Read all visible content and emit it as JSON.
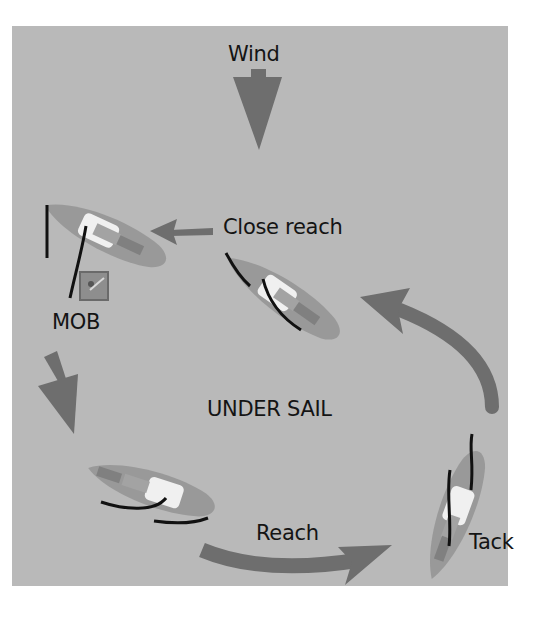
{
  "diagram": {
    "title": "UNDER SAIL",
    "colors": {
      "background": "#b9b9b9",
      "arrow": "#6e6e6e",
      "hull": "#989898",
      "deck_white": "#f2f2f2",
      "cockpit": "#8a8a8a",
      "sail": "#111111",
      "text": "#141414"
    },
    "labels": {
      "wind": "Wind",
      "close_reach": "Close reach",
      "mob": "MOB",
      "center": "UNDER SAIL",
      "reach": "Reach",
      "tack": "Tack"
    },
    "boats": [
      {
        "id": "boat-mob",
        "state": "head to wind, sails luffing",
        "near_label": "MOB"
      },
      {
        "id": "boat-close-reach",
        "state": "close reach",
        "near_label": "Close reach"
      },
      {
        "id": "boat-tack",
        "state": "tacking",
        "near_label": "Tack"
      },
      {
        "id": "boat-reach",
        "state": "reach",
        "near_label": "Reach"
      }
    ],
    "arrows": [
      {
        "id": "wind-arrow",
        "direction": "down"
      },
      {
        "id": "close-reach-arrow",
        "direction": "left"
      },
      {
        "id": "mob-down-arrow",
        "direction": "down-right"
      },
      {
        "id": "reach-arrow",
        "direction": "right"
      },
      {
        "id": "tack-to-close-reach-arrow",
        "direction": "up-left"
      }
    ],
    "icons": {
      "mob": "person-overboard-icon"
    }
  }
}
